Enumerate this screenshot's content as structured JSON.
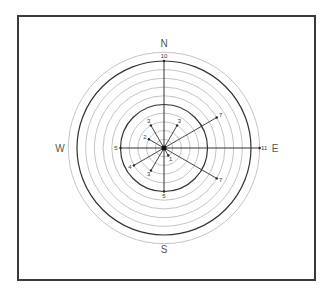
{
  "diagram": {
    "type": "polar vector diagram",
    "cardinals": {
      "north": "N",
      "east": "E",
      "south": "S",
      "west": "W"
    },
    "rings": {
      "count": 11,
      "major_rings": [
        5,
        10
      ]
    },
    "vectors": [
      {
        "direction_deg": 0,
        "magnitude": 10,
        "label": "10"
      },
      {
        "direction_deg": 30,
        "magnitude": 3,
        "label": "3"
      },
      {
        "direction_deg": 60,
        "magnitude": 7,
        "label": "7"
      },
      {
        "direction_deg": 90,
        "magnitude": 11,
        "label": "11"
      },
      {
        "direction_deg": 120,
        "magnitude": 7,
        "label": "7"
      },
      {
        "direction_deg": 150,
        "magnitude": 1,
        "label": "1"
      },
      {
        "direction_deg": 180,
        "magnitude": 5,
        "label": "5"
      },
      {
        "direction_deg": 210,
        "magnitude": 3,
        "label": "3"
      },
      {
        "direction_deg": 240,
        "magnitude": 4,
        "label": "4"
      },
      {
        "direction_deg": 270,
        "magnitude": 5,
        "label": "5"
      },
      {
        "direction_deg": 300,
        "magnitude": 2,
        "label": "2"
      },
      {
        "direction_deg": 330,
        "magnitude": 3,
        "label": "3"
      }
    ]
  }
}
